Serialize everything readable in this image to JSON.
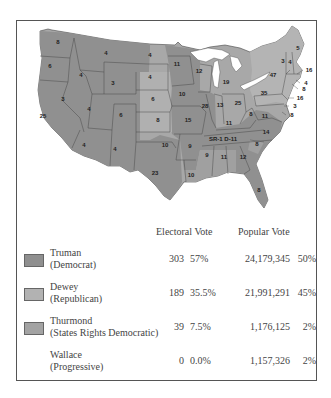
{
  "colors": {
    "truman": "#8f8f8f",
    "dewey": "#b2b2b2",
    "thurmond": "#a3a3a3",
    "border": "#555555",
    "state_border": "#444444",
    "lakes": "#ffffff"
  },
  "map": {
    "states": [
      {
        "abbr": "WA",
        "ev": "8",
        "party": "truman",
        "x": 58,
        "y": 44
      },
      {
        "abbr": "OR",
        "ev": "6",
        "party": "truman",
        "x": 50,
        "y": 68
      },
      {
        "abbr": "CA",
        "ev": "25",
        "party": "truman",
        "x": 43,
        "y": 118
      },
      {
        "abbr": "NV",
        "ev": "3",
        "party": "truman",
        "x": 63,
        "y": 101
      },
      {
        "abbr": "ID",
        "ev": "4",
        "party": "truman",
        "x": 81,
        "y": 77
      },
      {
        "abbr": "MT",
        "ev": "4",
        "party": "truman",
        "x": 106,
        "y": 55
      },
      {
        "abbr": "WY",
        "ev": "3",
        "party": "truman",
        "x": 113,
        "y": 85
      },
      {
        "abbr": "UT",
        "ev": "4",
        "party": "truman",
        "x": 89,
        "y": 111
      },
      {
        "abbr": "CO",
        "ev": "6",
        "party": "truman",
        "x": 121,
        "y": 117
      },
      {
        "abbr": "AZ",
        "ev": "4",
        "party": "truman",
        "x": 84,
        "y": 147
      },
      {
        "abbr": "NM",
        "ev": "4",
        "party": "truman",
        "x": 115,
        "y": 151
      },
      {
        "abbr": "ND",
        "ev": "4",
        "party": "truman",
        "x": 150,
        "y": 57
      },
      {
        "abbr": "SD",
        "ev": "4",
        "party": "dewey",
        "x": 150,
        "y": 79
      },
      {
        "abbr": "NE",
        "ev": "6",
        "party": "dewey",
        "x": 153,
        "y": 101
      },
      {
        "abbr": "KS",
        "ev": "8",
        "party": "dewey",
        "x": 158,
        "y": 122
      },
      {
        "abbr": "OK",
        "ev": "10",
        "party": "truman",
        "x": 165,
        "y": 147
      },
      {
        "abbr": "TX",
        "ev": "23",
        "party": "truman",
        "x": 155,
        "y": 175
      },
      {
        "abbr": "MN",
        "ev": "11",
        "party": "truman",
        "x": 177,
        "y": 66
      },
      {
        "abbr": "IA",
        "ev": "10",
        "party": "truman",
        "x": 182,
        "y": 96
      },
      {
        "abbr": "MO",
        "ev": "15",
        "party": "truman",
        "x": 188,
        "y": 122
      },
      {
        "abbr": "AR",
        "ev": "9",
        "party": "truman",
        "x": 190,
        "y": 148
      },
      {
        "abbr": "LA",
        "ev": "10",
        "party": "thurmond",
        "x": 191,
        "y": 177
      },
      {
        "abbr": "WI",
        "ev": "12",
        "party": "truman",
        "x": 199,
        "y": 73
      },
      {
        "abbr": "IL",
        "ev": "28",
        "party": "truman",
        "x": 205,
        "y": 108
      },
      {
        "abbr": "MI",
        "ev": "19",
        "party": "dewey",
        "x": 226,
        "y": 84
      },
      {
        "abbr": "IN",
        "ev": "13",
        "party": "dewey",
        "x": 220,
        "y": 107
      },
      {
        "abbr": "OH",
        "ev": "25",
        "party": "truman",
        "x": 238,
        "y": 105
      },
      {
        "abbr": "KY",
        "ev": "11",
        "party": "truman",
        "x": 229,
        "y": 125
      },
      {
        "abbr": "TN",
        "ev": "SR-1  D-11",
        "party": "truman",
        "x": 223,
        "y": 141
      },
      {
        "abbr": "MS",
        "ev": "9",
        "party": "thurmond",
        "x": 207,
        "y": 157
      },
      {
        "abbr": "AL",
        "ev": "11",
        "party": "thurmond",
        "x": 224,
        "y": 159
      },
      {
        "abbr": "GA",
        "ev": "12",
        "party": "truman",
        "x": 243,
        "y": 159
      },
      {
        "abbr": "FL",
        "ev": "8",
        "party": "truman",
        "x": 259,
        "y": 192
      },
      {
        "abbr": "SC",
        "ev": "8",
        "party": "thurmond",
        "x": 257,
        "y": 146
      },
      {
        "abbr": "NC",
        "ev": "14",
        "party": "truman",
        "x": 266,
        "y": 134
      },
      {
        "abbr": "VA",
        "ev": "11",
        "party": "truman",
        "x": 265,
        "y": 118
      },
      {
        "abbr": "WV",
        "ev": "8",
        "party": "truman",
        "x": 251,
        "y": 116
      },
      {
        "abbr": "PA",
        "ev": "35",
        "party": "dewey",
        "x": 264,
        "y": 95
      },
      {
        "abbr": "NY",
        "ev": "47",
        "party": "dewey",
        "x": 273,
        "y": 77
      },
      {
        "abbr": "VT",
        "ev": "3",
        "party": "dewey",
        "x": 283,
        "y": 63
      },
      {
        "abbr": "NH",
        "ev": "4",
        "party": "dewey",
        "x": 290,
        "y": 64
      },
      {
        "abbr": "ME",
        "ev": "5",
        "party": "dewey",
        "x": 298,
        "y": 50
      }
    ],
    "callouts": [
      {
        "abbr": "MA",
        "ev": "16",
        "x": 305,
        "y": 70
      },
      {
        "abbr": "RI",
        "ev": "4",
        "x": 302,
        "y": 83
      },
      {
        "abbr": "CT",
        "ev": "8",
        "x": 300,
        "y": 89
      },
      {
        "abbr": "NJ",
        "ev": "16",
        "x": 296,
        "y": 98
      },
      {
        "abbr": "DE",
        "ev": "3",
        "x": 291,
        "y": 106
      },
      {
        "abbr": "MD",
        "ev": "8",
        "x": 288,
        "y": 115
      }
    ]
  },
  "table": {
    "headers": {
      "electoral": "Electoral Vote",
      "popular": "Popular Vote"
    },
    "rows": [
      {
        "candidate": "Truman",
        "party": "(Democrat)",
        "ev": "303",
        "ev_pct": "57%",
        "pv": "24,179,345",
        "pv_pct": "50%",
        "swatch": true,
        "color": "#8f8f8f"
      },
      {
        "candidate": "Dewey",
        "party": "(Republican)",
        "ev": "189",
        "ev_pct": "35.5%",
        "pv": "21,991,291",
        "pv_pct": "45%",
        "swatch": true,
        "color": "#b2b2b2"
      },
      {
        "candidate": "Thurmond",
        "party": "(States Rights Democratic)",
        "ev": "39",
        "ev_pct": "7.5%",
        "pv": "1,176,125",
        "pv_pct": "2%",
        "swatch": true,
        "color": "#a3a3a3"
      },
      {
        "candidate": "Wallace",
        "party": "(Progressive)",
        "ev": "0",
        "ev_pct": "0.0%",
        "pv": "1,157,326",
        "pv_pct": "2%",
        "swatch": false,
        "color": ""
      }
    ]
  }
}
